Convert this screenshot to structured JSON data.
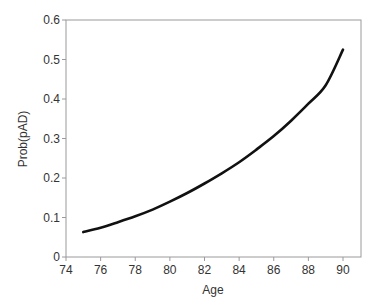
{
  "chart_data": {
    "type": "line",
    "title": "",
    "xlabel": "Age",
    "ylabel": "Prob(pAD)",
    "xlim": [
      74,
      91
    ],
    "ylim": [
      0,
      0.6
    ],
    "xticks": [
      "74",
      "76",
      "78",
      "80",
      "82",
      "84",
      "86",
      "88",
      "90"
    ],
    "yticks": [
      "0",
      "0.1",
      "0.2",
      "0.3",
      "0.4",
      "0.5",
      "0.6"
    ],
    "grid": false,
    "legend": null,
    "series": [
      {
        "name": "Prob(pAD)",
        "color": "#111111",
        "x": [
          75,
          76,
          77,
          78,
          79,
          80,
          81,
          82,
          83,
          84,
          85,
          86,
          87,
          88,
          89,
          90
        ],
        "values": [
          0.063,
          0.074,
          0.088,
          0.103,
          0.12,
          0.14,
          0.162,
          0.186,
          0.212,
          0.24,
          0.272,
          0.306,
          0.345,
          0.388,
          0.435,
          0.525
        ]
      }
    ]
  }
}
